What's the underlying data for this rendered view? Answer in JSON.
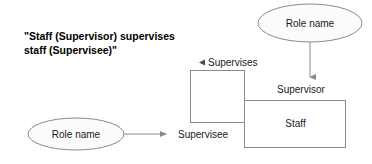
{
  "diagram": {
    "caption": "\"Staff (Supervisor) supervises staff (Supervisee)\"",
    "colors": {
      "stroke": "#8a8a8a",
      "text": "#1a1a1a",
      "caption_text": "#000000",
      "ellipse_fill": "#fbfbfb",
      "box_fill": "#ffffff",
      "background": "#ffffff"
    },
    "ellipses": [
      {
        "id": "role-name-top",
        "label": "Role name"
      },
      {
        "id": "role-name-bottom",
        "label": "Role name"
      }
    ],
    "boxes": [
      {
        "id": "supervises-box",
        "label": ""
      },
      {
        "id": "staff-box",
        "label": "Staff"
      }
    ],
    "labels": {
      "supervises": "Supervises",
      "supervisor": "Supervisor",
      "supervisee": "Supervisee",
      "staff": "Staff"
    },
    "icons": {
      "supervises_marker": "triangle-left-icon",
      "arrow_down": "arrow-down-icon",
      "arrow_right": "arrow-right-icon"
    }
  }
}
